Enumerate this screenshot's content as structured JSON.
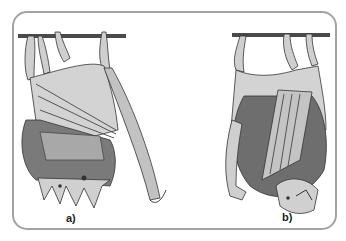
{
  "figure": {
    "type": "illustration",
    "panels": [
      {
        "id": "a",
        "label": "a)",
        "description": "bat hanging with wings partially open, head at bottom"
      },
      {
        "id": "b",
        "label": "b)",
        "description": "bat hanging wrapped in wings, head turned sideways"
      }
    ]
  },
  "colors": {
    "frame": "#a3a3a3",
    "membrane": "#c8c8c8",
    "membrane_dark": "#9a9a9a",
    "fur": "#6a6a6a",
    "branch": "#4a4a4a",
    "outline": "#333333"
  }
}
